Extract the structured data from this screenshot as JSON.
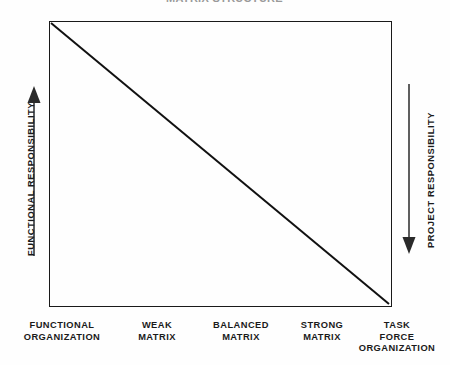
{
  "chart_data": {
    "type": "line",
    "title": "",
    "title_clipped": true,
    "xlabel": "",
    "ylabel": "",
    "grid": false,
    "legend": "none",
    "categories": [
      "FUNCTIONAL ORGANIZATION",
      "WEAK MATRIX",
      "BALANCED MATRIX",
      "STRONG MATRIX",
      "TASK FORCE ORGANIZATION"
    ],
    "x": [
      0,
      1,
      2,
      3,
      4
    ],
    "xlim": [
      0,
      4
    ],
    "ylim": [
      0,
      100
    ],
    "series": [
      {
        "name": "Functional responsibility",
        "values": [
          100,
          75,
          50,
          25,
          0
        ]
      },
      {
        "name": "Project responsibility",
        "values": [
          0,
          25,
          50,
          75,
          100
        ]
      }
    ],
    "axes": {
      "left": {
        "label": "FUNCTIONAL RESPONSIBILITY",
        "arrow": "up",
        "arrow_icon": "arrow-up-icon"
      },
      "right": {
        "label": "PROJECT RESPONSIBILITY",
        "arrow": "down",
        "arrow_icon": "arrow-down-icon"
      }
    }
  },
  "figure": {
    "title": "MATRIX STRUCTURE",
    "title_visible": false,
    "plot_border_color": "#1a1a1a",
    "diagonal_color": "#111111",
    "background_color": "#fefefe",
    "text_color": "#1a1a1a"
  },
  "x_axis_labels": [
    {
      "id": "functional-organization",
      "lines": [
        "FUNCTIONAL",
        "ORGANIZATION"
      ],
      "center_x": 62
    },
    {
      "id": "weak-matrix",
      "lines": [
        "WEAK",
        "MATRIX"
      ],
      "center_x": 157
    },
    {
      "id": "balanced-matrix",
      "lines": [
        "BALANCED",
        "MATRIX"
      ],
      "center_x": 241
    },
    {
      "id": "strong-matrix",
      "lines": [
        "STRONG",
        "MATRIX"
      ],
      "center_x": 322
    },
    {
      "id": "task-force-organization",
      "lines": [
        "TASK",
        "FORCE",
        "ORGANIZATION"
      ],
      "center_x": 397
    }
  ]
}
